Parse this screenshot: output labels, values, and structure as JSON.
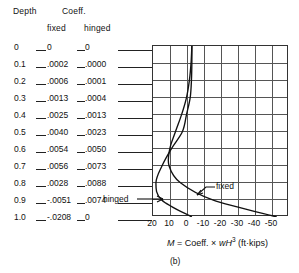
{
  "figure": {
    "sublabel": "(b)",
    "equation_prefix": "M",
    "equation_eq": " = Coeff. ",
    "equation_times": "×",
    "equation_var_w": " wH",
    "equation_exp": "3",
    "equation_units": " (ft·kips)",
    "equation_plain": "M = Coeff. × wH3 (ft·kips)"
  },
  "table": {
    "header_depth": "Depth",
    "header_coeff": "Coeff.",
    "subheader_fixed": "fixed",
    "subheader_hinged": "hinged",
    "rows": [
      {
        "depth": "0",
        "fixed": "0",
        "hinged": "0"
      },
      {
        "depth": "0.1",
        "fixed": ".0002",
        "hinged": ".0000"
      },
      {
        "depth": "0.2",
        "fixed": ".0006",
        "hinged": ".0001"
      },
      {
        "depth": "0.3",
        "fixed": ".0013",
        "hinged": ".0004"
      },
      {
        "depth": "0.4",
        "fixed": ".0025",
        "hinged": ".0013"
      },
      {
        "depth": "0.5",
        "fixed": ".0040",
        "hinged": ".0023"
      },
      {
        "depth": "0.6",
        "fixed": ".0054",
        "hinged": ".0050"
      },
      {
        "depth": "0.7",
        "fixed": ".0056",
        "hinged": ".0073"
      },
      {
        "depth": "0.8",
        "fixed": ".0028",
        "hinged": ".0088"
      },
      {
        "depth": "0.9",
        "fixed": "-.0051",
        "hinged": ".0074"
      },
      {
        "depth": "1.0",
        "fixed": "-.0208",
        "hinged": "0"
      }
    ]
  },
  "annotations": {
    "fixed_label": "fixed",
    "hinged_label": "hinged"
  },
  "chart_data": {
    "type": "line",
    "title": "",
    "xlabel": "M = Coeff. × wH3 (ft·kips)",
    "ylabel": "Depth",
    "xlim": [
      20,
      -50
    ],
    "ylim": [
      0,
      1.0
    ],
    "grid": true,
    "x_ticks": [
      "20",
      "10",
      "0",
      "-10",
      "-20",
      "-30",
      "-40",
      "-50"
    ],
    "x_tick_values": [
      20,
      10,
      0,
      -10,
      -20,
      -30,
      -40,
      -50
    ],
    "y_ticks": [
      "0",
      "0.1",
      "0.2",
      "0.3",
      "0.4",
      "0.5",
      "0.6",
      "0.7",
      "0.8",
      "0.9",
      "1.0"
    ],
    "legend_position": "inline-annotations",
    "series": [
      {
        "name": "fixed",
        "y": [
          0,
          0.1,
          0.2,
          0.3,
          0.4,
          0.5,
          0.6,
          0.7,
          0.8,
          0.9,
          1.0
        ],
        "values": [
          0,
          0.0002,
          0.0006,
          0.0013,
          0.0025,
          0.004,
          0.0054,
          0.0056,
          0.0028,
          -0.0051,
          -0.0208
        ]
      },
      {
        "name": "hinged",
        "y": [
          0,
          0.1,
          0.2,
          0.3,
          0.4,
          0.5,
          0.6,
          0.7,
          0.8,
          0.9,
          1.0
        ],
        "values": [
          0,
          0.0,
          0.0001,
          0.0004,
          0.0013,
          0.0023,
          0.005,
          0.0073,
          0.0088,
          0.0074,
          0
        ]
      }
    ]
  }
}
